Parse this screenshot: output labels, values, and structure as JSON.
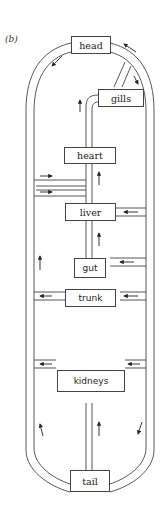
{
  "figure_label": "(b)",
  "organs": {
    "head": "head",
    "gills": "gills",
    "heart": "heart",
    "liver": "liver",
    "gut": "gut",
    "trunk": "trunk",
    "kidneys": "kidneys",
    "tail": "tail"
  },
  "colors": {
    "line": "#444444",
    "background": "#ffffff"
  }
}
